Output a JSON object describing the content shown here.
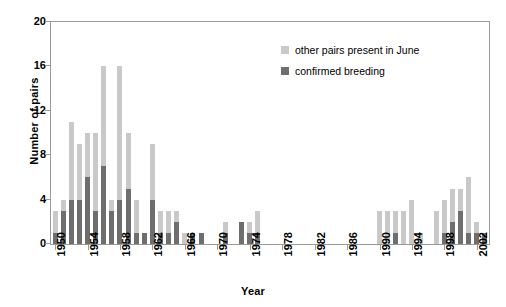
{
  "chart_data": {
    "type": "bar",
    "title": "",
    "xlabel": "Year",
    "ylabel": "Number of pairs",
    "ylim": [
      0,
      20
    ],
    "yticks": [
      0,
      4,
      8,
      12,
      16,
      20
    ],
    "xlim": [
      1950,
      2003
    ],
    "xticks": [
      1950,
      1954,
      1958,
      1962,
      1966,
      1970,
      1974,
      1978,
      1982,
      1986,
      1990,
      1994,
      1998,
      2002
    ],
    "grid": false,
    "stacked": true,
    "legend_position": "upper-right-inside",
    "colors": {
      "other_pairs": "#c9c9c9",
      "confirmed_breeding": "#6e6e6e",
      "axis": "#9a9a9a",
      "text": "#000000",
      "background": "#ffffff"
    },
    "series": [
      {
        "name": "confirmed breeding",
        "color": "#6e6e6e",
        "values": [
          1,
          3,
          4,
          4,
          6,
          3,
          7,
          3,
          4,
          5,
          1,
          1,
          4,
          1,
          1,
          2,
          0,
          1,
          1,
          0,
          0,
          1,
          0,
          2,
          1,
          1,
          0,
          0,
          0,
          0,
          0,
          0,
          0,
          0,
          0,
          0,
          0,
          0,
          0,
          0,
          0,
          0,
          1,
          0,
          0,
          0,
          0,
          0,
          1,
          2,
          3,
          1,
          1,
          1
        ]
      },
      {
        "name": "other pairs present in June",
        "color": "#c9c9c9",
        "values": [
          2,
          1,
          7,
          5,
          4,
          7,
          9,
          1,
          12,
          5,
          3,
          0,
          5,
          2,
          2,
          1,
          1,
          0,
          0,
          0,
          0,
          1,
          0,
          0,
          1,
          2,
          0,
          0,
          0,
          0,
          0,
          0,
          0,
          0,
          0,
          0,
          0,
          0,
          0,
          0,
          3,
          3,
          2,
          3,
          4,
          1,
          0,
          3,
          3,
          3,
          2,
          5,
          1,
          0
        ]
      }
    ],
    "categories": [
      1950,
      1951,
      1952,
      1953,
      1954,
      1955,
      1956,
      1957,
      1958,
      1959,
      1960,
      1961,
      1962,
      1963,
      1964,
      1965,
      1966,
      1967,
      1968,
      1969,
      1970,
      1971,
      1972,
      1973,
      1974,
      1975,
      1976,
      1977,
      1978,
      1979,
      1980,
      1981,
      1982,
      1983,
      1984,
      1985,
      1986,
      1987,
      1988,
      1989,
      1990,
      1991,
      1992,
      1993,
      1994,
      1995,
      1996,
      1997,
      1998,
      1999,
      2000,
      2001,
      2002,
      2003
    ],
    "totals": [
      3,
      4,
      11,
      9,
      10,
      10,
      16,
      4,
      16,
      10,
      4,
      1,
      9,
      3,
      3,
      3,
      1,
      1,
      1,
      0,
      0,
      2,
      0,
      2,
      2,
      3,
      0,
      0,
      0,
      0,
      0,
      0,
      0,
      0,
      0,
      0,
      0,
      0,
      0,
      0,
      3,
      3,
      3,
      3,
      4,
      1,
      0,
      3,
      4,
      5,
      5,
      6,
      2,
      1
    ],
    "legend": [
      {
        "label": "other pairs present in June",
        "color": "#c9c9c9"
      },
      {
        "label": "confirmed breeding",
        "color": "#6e6e6e"
      }
    ]
  }
}
